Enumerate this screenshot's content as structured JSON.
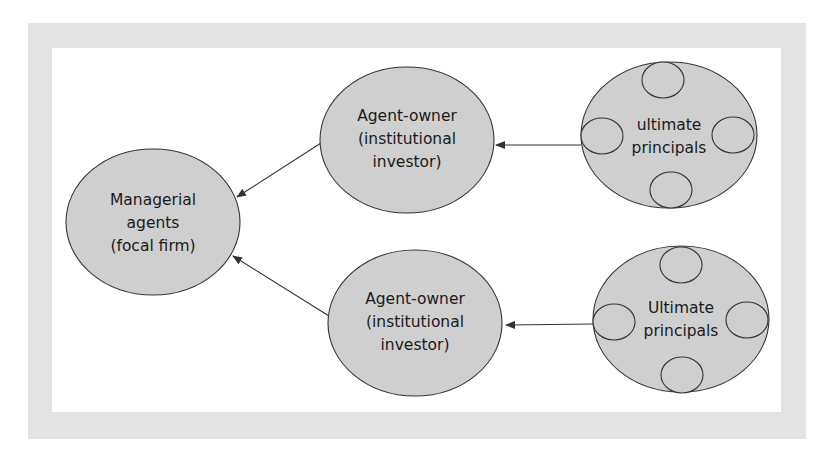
{
  "diagram": {
    "colors": {
      "frame": "#e3e3e3",
      "background": "#ffffff",
      "node_fill": "#cfcfcf",
      "stroke": "#333333",
      "text": "#1a1a1a"
    },
    "nodes": {
      "managerial": {
        "lines": [
          "Managerial",
          "agents",
          "(focal firm)"
        ]
      },
      "agent_owner_top": {
        "lines": [
          "Agent-owner",
          "(institutional",
          "investor)"
        ]
      },
      "agent_owner_bottom": {
        "lines": [
          "Agent-owner",
          "(institutional",
          "investor)"
        ]
      },
      "principals_top": {
        "lines": [
          "ultimate",
          "principals"
        ]
      },
      "principals_bottom": {
        "lines": [
          "Ultimate",
          "principals"
        ]
      }
    },
    "edges": [
      {
        "from": "principals_top",
        "to": "agent_owner_top"
      },
      {
        "from": "principals_bottom",
        "to": "agent_owner_bottom"
      },
      {
        "from": "agent_owner_top",
        "to": "managerial"
      },
      {
        "from": "agent_owner_bottom",
        "to": "managerial"
      }
    ]
  }
}
